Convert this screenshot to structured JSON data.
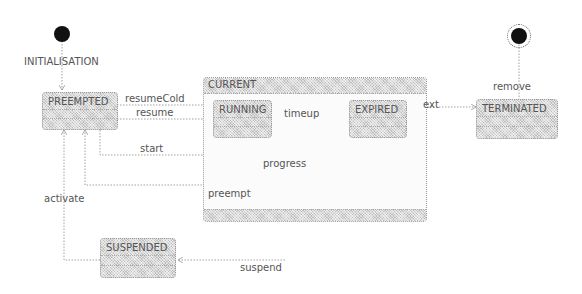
{
  "diagram": {
    "type": "state-machine",
    "pseudo_states": {
      "initial": {
        "label": "INITIALISATION"
      },
      "final": {}
    },
    "states": {
      "preempted": {
        "label": "PREEMPTED"
      },
      "current": {
        "label": "CURRENT"
      },
      "running": {
        "label": "RUNNING"
      },
      "expired": {
        "label": "EXPIRED"
      },
      "terminated": {
        "label": "TERMINATED"
      },
      "suspended": {
        "label": "SUSPENDED"
      }
    },
    "transitions": {
      "resumeCold": {
        "label": "resumeCold",
        "from": "PREEMPTED",
        "to": "RUNNING"
      },
      "resume": {
        "label": "resume",
        "from": "PREEMPTED",
        "to": "RUNNING"
      },
      "start": {
        "label": "start",
        "from": "PREEMPTED",
        "to": "RUNNING"
      },
      "timeup": {
        "label": "timeup",
        "from": "RUNNING",
        "to": "EXPIRED"
      },
      "progress": {
        "label": "progress",
        "from": "RUNNING",
        "to": "RUNNING"
      },
      "ext": {
        "label": "ext",
        "from": "CURRENT",
        "to": "TERMINATED"
      },
      "preempt": {
        "label": "preempt",
        "from": "EXPIRED",
        "to": "PREEMPTED"
      },
      "remove": {
        "label": "remove",
        "from": "TERMINATED",
        "to": "final"
      },
      "activate": {
        "label": "activate",
        "from": "SUSPENDED",
        "to": "PREEMPTED"
      },
      "suspend": {
        "label": "suspend",
        "from": "CURRENT",
        "to": "SUSPENDED"
      }
    }
  }
}
